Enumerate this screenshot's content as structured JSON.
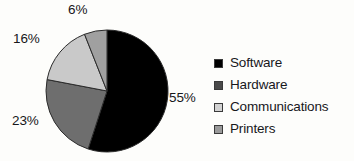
{
  "chart_data": {
    "type": "pie",
    "title": "",
    "categories": [
      "Software",
      "Hardware",
      "Communications",
      "Printers"
    ],
    "values": [
      55,
      23,
      16,
      6
    ],
    "value_labels": [
      "55%",
      "23%",
      "16%",
      "6%"
    ],
    "unit": "%",
    "start_angle_deg": 0,
    "direction": "clockwise",
    "legend_position": "right",
    "grid": false,
    "colors": [
      "#000000",
      "#6e6e6e",
      "#c9c9c9",
      "#a0a0a0"
    ],
    "slice_border_color": "#2b2b2b",
    "background": "#fdfdfb"
  },
  "chart": {
    "slices": [
      {
        "label": "Software",
        "value": 55,
        "value_label": "55%",
        "color": "#000000"
      },
      {
        "label": "Hardware",
        "value": 23,
        "value_label": "23%",
        "color": "#6e6e6e"
      },
      {
        "label": "Communications",
        "value": 16,
        "value_label": "16%",
        "color": "#c9c9c9"
      },
      {
        "label": "Printers",
        "value": 6,
        "value_label": "6%",
        "color": "#a0a0a0"
      }
    ]
  },
  "legend": {
    "items": [
      {
        "label": "Software",
        "color": "#000000"
      },
      {
        "label": "Hardware",
        "color": "#4a4a4a"
      },
      {
        "label": "Communications",
        "color": "#d2d2d2"
      },
      {
        "label": "Printers",
        "color": "#9a9a9a"
      }
    ]
  }
}
